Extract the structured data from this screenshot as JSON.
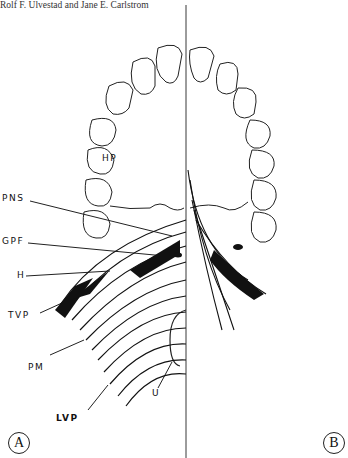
{
  "header": {
    "authors": "Rolf F. Ulvestad and Jane E. Carlstrom"
  },
  "figure": {
    "labels": {
      "hp": "HP",
      "pns": "PNS",
      "gpf": "GPF",
      "h": "H",
      "tvp": "TVP",
      "pm": "PM",
      "u": "U",
      "lvp": "LVP"
    },
    "panels": {
      "a": "A",
      "b": "B"
    }
  }
}
